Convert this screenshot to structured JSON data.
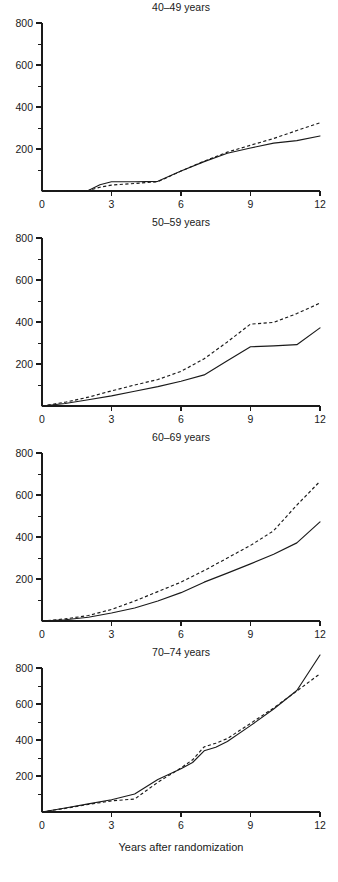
{
  "figure": {
    "panel_count": 4,
    "xlabel": "Years after randomization",
    "line_color": "#1a1a1a",
    "background": "#ffffff"
  },
  "chart_data": [
    {
      "type": "line",
      "title": "40–49 years",
      "xlabel": "",
      "ylabel": "",
      "xlim": [
        0,
        12
      ],
      "ylim": [
        0,
        800
      ],
      "xticks": [
        0,
        3,
        6,
        9,
        12
      ],
      "xtick_labels": [
        "0",
        "3",
        "6",
        "9",
        "12"
      ],
      "yticks": [
        0,
        200,
        400,
        600,
        800
      ],
      "ytick_labels": [
        "0",
        "200",
        "400",
        "600",
        "800"
      ],
      "yticks_minor": [
        100,
        300,
        500,
        700
      ],
      "grid": false,
      "legend": "none",
      "series": [
        {
          "name": "solid",
          "style": "solid",
          "x": [
            0,
            1,
            2,
            2.5,
            3,
            4,
            5,
            6,
            7,
            8,
            9,
            10,
            11,
            12
          ],
          "values": [
            0,
            0,
            2,
            30,
            44,
            44,
            46,
            95,
            140,
            180,
            205,
            228,
            240,
            262
          ]
        },
        {
          "name": "dashed",
          "style": "dashed",
          "x": [
            0,
            1,
            2,
            2.5,
            3,
            4,
            5,
            6,
            7,
            8,
            9,
            10,
            11,
            12
          ],
          "values": [
            0,
            0,
            2,
            18,
            28,
            36,
            44,
            95,
            142,
            185,
            218,
            250,
            288,
            325
          ]
        }
      ]
    },
    {
      "type": "line",
      "title": "50–59 years",
      "xlabel": "",
      "ylabel": "",
      "xlim": [
        0,
        12
      ],
      "ylim": [
        0,
        800
      ],
      "xticks": [
        0,
        3,
        6,
        9,
        12
      ],
      "xtick_labels": [
        "0",
        "3",
        "6",
        "9",
        "12"
      ],
      "yticks": [
        0,
        200,
        400,
        600,
        800
      ],
      "ytick_labels": [
        "0",
        "200",
        "400",
        "600",
        "800"
      ],
      "yticks_minor": [
        100,
        300,
        500,
        700
      ],
      "grid": false,
      "legend": "none",
      "series": [
        {
          "name": "solid",
          "style": "solid",
          "x": [
            0,
            1,
            2,
            3,
            4,
            5,
            6,
            7,
            8,
            9,
            10,
            11,
            12
          ],
          "values": [
            0,
            12,
            30,
            48,
            70,
            92,
            118,
            148,
            215,
            282,
            286,
            292,
            372
          ]
        },
        {
          "name": "dashed",
          "style": "dashed",
          "x": [
            0,
            1,
            2,
            3,
            4,
            5,
            6,
            7,
            8,
            9,
            10,
            11,
            12
          ],
          "values": [
            0,
            18,
            42,
            72,
            100,
            126,
            165,
            225,
            305,
            390,
            398,
            440,
            490
          ]
        }
      ]
    },
    {
      "type": "line",
      "title": "60–69 years",
      "xlabel": "",
      "ylabel": "",
      "xlim": [
        0,
        12
      ],
      "ylim": [
        0,
        800
      ],
      "xticks": [
        0,
        3,
        6,
        9,
        12
      ],
      "xtick_labels": [
        "0",
        "3",
        "6",
        "9",
        "12"
      ],
      "yticks": [
        0,
        200,
        400,
        600,
        800
      ],
      "ytick_labels": [
        "0",
        "200",
        "400",
        "600",
        "800"
      ],
      "yticks_minor": [
        100,
        300,
        500,
        700
      ],
      "grid": false,
      "legend": "none",
      "series": [
        {
          "name": "solid",
          "style": "solid",
          "x": [
            0,
            1,
            2,
            3,
            4,
            5,
            6,
            7,
            8,
            9,
            10,
            11,
            12
          ],
          "values": [
            0,
            6,
            18,
            38,
            62,
            95,
            135,
            185,
            228,
            272,
            318,
            372,
            472
          ]
        },
        {
          "name": "dashed",
          "style": "dashed",
          "x": [
            0,
            1,
            2,
            3,
            4,
            5,
            6,
            7,
            8,
            9,
            10,
            11,
            12
          ],
          "values": [
            0,
            10,
            26,
            55,
            95,
            140,
            185,
            240,
            300,
            360,
            430,
            552,
            665
          ]
        }
      ]
    },
    {
      "type": "line",
      "title": "70–74 years",
      "xlabel": "Years after randomization",
      "ylabel": "",
      "xlim": [
        0,
        12
      ],
      "ylim": [
        0,
        800
      ],
      "xticks": [
        0,
        3,
        6,
        9,
        12
      ],
      "xtick_labels": [
        "0",
        "3",
        "6",
        "9",
        "12"
      ],
      "yticks": [
        0,
        200,
        400,
        600,
        800
      ],
      "ytick_labels": [
        "0",
        "200",
        "400",
        "600",
        "800"
      ],
      "yticks_minor": [
        100,
        300,
        500,
        700
      ],
      "grid": false,
      "legend": "none",
      "series": [
        {
          "name": "solid",
          "style": "solid",
          "x": [
            0,
            1,
            2,
            3,
            4,
            5,
            6,
            6.5,
            7,
            7.5,
            8,
            9,
            10,
            11,
            12
          ],
          "values": [
            0,
            22,
            45,
            68,
            100,
            180,
            240,
            275,
            340,
            360,
            392,
            480,
            572,
            675,
            872
          ]
        },
        {
          "name": "dashed",
          "style": "dashed",
          "x": [
            0,
            1,
            2,
            3,
            4,
            5,
            6,
            6.5,
            7,
            7.5,
            8,
            9,
            10,
            11,
            12
          ],
          "values": [
            0,
            20,
            42,
            62,
            72,
            165,
            245,
            290,
            362,
            382,
            408,
            492,
            578,
            672,
            768
          ]
        }
      ]
    }
  ]
}
